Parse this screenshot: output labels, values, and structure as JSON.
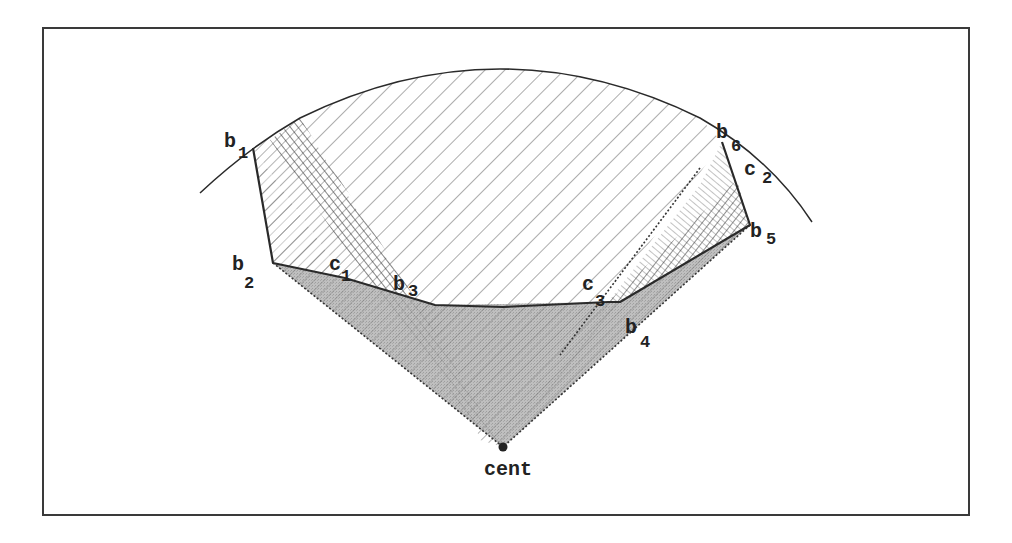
{
  "figure": {
    "colors": {
      "frame": "#3a3a3a",
      "line": "#2a2a2a",
      "hatch": "#555555",
      "gray_fill": "#a9a9a9",
      "background": "#ffffff"
    },
    "labels": {
      "b1": {
        "base": "b",
        "sub": "1"
      },
      "b2": {
        "base": "b",
        "sub": "2"
      },
      "b3": {
        "base": "b",
        "sub": "3"
      },
      "b4": {
        "base": "b",
        "sub": "4"
      },
      "b5": {
        "base": "b",
        "sub": "5"
      },
      "b6": {
        "base": "b",
        "sub": "6"
      },
      "c1": {
        "base": "c",
        "sub": "1"
      },
      "c2": {
        "base": "c",
        "sub": "2"
      },
      "c3": {
        "base": "c",
        "sub": "3"
      },
      "cent": "cent"
    },
    "points": {
      "cent": [
        503,
        447
      ],
      "b1": [
        253,
        148
      ],
      "b2": [
        273,
        263
      ],
      "c1": [
        345,
        278
      ],
      "b3": [
        435,
        305
      ],
      "b4": [
        620,
        302
      ],
      "b5": [
        750,
        225
      ],
      "b6": [
        722,
        142
      ],
      "c2": [
        737,
        180
      ],
      "c3": [
        608,
        302
      ]
    }
  }
}
